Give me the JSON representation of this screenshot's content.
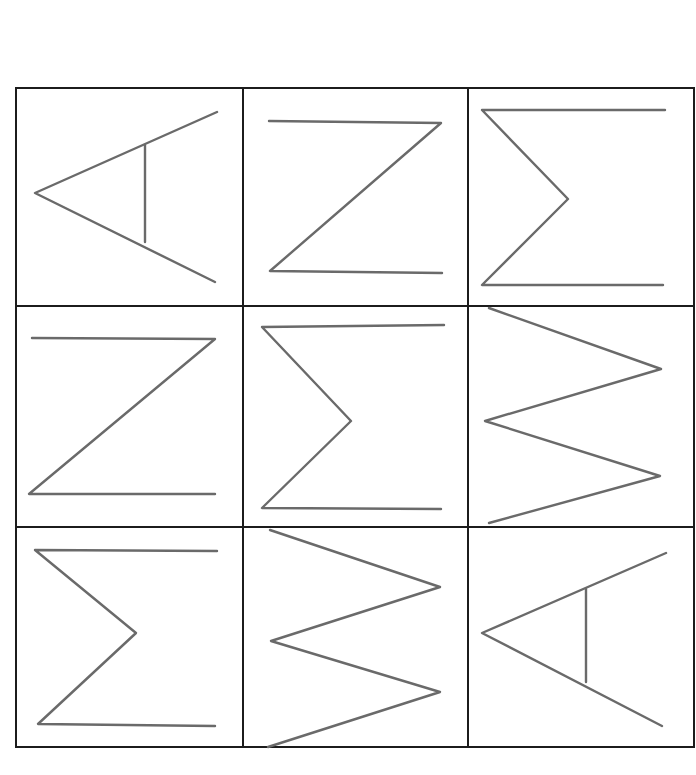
{
  "figure": {
    "title": "3x3 matrix of line figures (rotated letter shapes)",
    "rows": 3,
    "cols": 3,
    "line_color": "#6a6a6a",
    "border_color": "#1c1c1c",
    "cells": [
      {
        "row": 0,
        "col": 0,
        "shape": "arrowhead-left-with-bar",
        "description": "Left-pointing angle with vertical bar (rotated A)"
      },
      {
        "row": 0,
        "col": 1,
        "shape": "z-shape",
        "description": "Z shape"
      },
      {
        "row": 0,
        "col": 2,
        "shape": "sigma-shape",
        "description": "Sigma shape"
      },
      {
        "row": 1,
        "col": 0,
        "shape": "z-shape",
        "description": "Z shape"
      },
      {
        "row": 1,
        "col": 1,
        "shape": "sigma-shape",
        "description": "Sigma shape"
      },
      {
        "row": 1,
        "col": 2,
        "shape": "zigzag-w-shape",
        "description": "Zigzag (rotated W/M)"
      },
      {
        "row": 2,
        "col": 0,
        "shape": "sigma-shape",
        "description": "Sigma shape"
      },
      {
        "row": 2,
        "col": 1,
        "shape": "zigzag-w-shape",
        "description": "Zigzag (rotated W/M)"
      },
      {
        "row": 2,
        "col": 2,
        "shape": "arrowhead-left-with-bar",
        "description": "Left-pointing angle with vertical bar (rotated A)"
      }
    ]
  }
}
